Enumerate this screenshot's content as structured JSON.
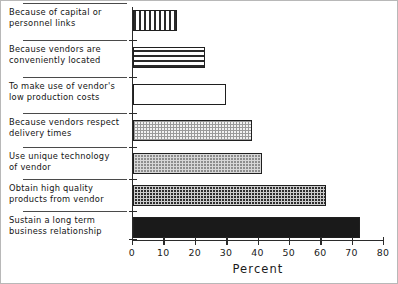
{
  "chart_data": {
    "type": "bar",
    "orientation": "horizontal",
    "title": "",
    "xlabel": "Percent",
    "ylabel": "",
    "xlim": [
      0,
      80
    ],
    "xticks": [
      0,
      10,
      20,
      30,
      40,
      50,
      60,
      70,
      80
    ],
    "xtick_labels": [
      "0",
      "10",
      "20",
      "30",
      "40",
      "50",
      "60",
      "70",
      "80"
    ],
    "grid": false,
    "legend": false,
    "categories": [
      "Because of capital or\npersonnel links",
      "Because vendors are\nconveniently located",
      "To make use of vendor's\nlow production costs",
      "Because vendors respect\ndelivery times",
      "Use unique technology\nof vendor",
      "Obtain high quality\nproducts from vendor",
      "Sustain a long term\nbusiness relationship"
    ],
    "values": [
      14,
      23,
      29.5,
      38,
      41,
      61.5,
      72.5
    ],
    "bar_fills": [
      "vertical-stripes",
      "horizontal-stripes",
      "empty-white",
      "light-checker",
      "gray-dotted",
      "dark-checker",
      "solid-black"
    ]
  },
  "axis": {
    "x_title": "Percent"
  }
}
